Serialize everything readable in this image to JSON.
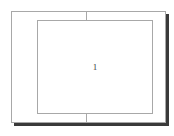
{
  "figure": {
    "background_color": "#ffffff",
    "stroke_color": "#a8a8a8",
    "shadow_color": "#3a3a3a",
    "label_color": "#3c3c3c",
    "outer_frame": {
      "name": "outer rectangle",
      "x": 11,
      "y": 11,
      "width": 155,
      "height": 112
    },
    "inner_frame": {
      "name": "inner rectangle",
      "x": 37,
      "y": 20,
      "width": 116,
      "height": 94
    },
    "dividers": [
      {
        "name": "top divider",
        "x": 86,
        "y": 11,
        "length": 10
      },
      {
        "name": "bottom divider",
        "x": 86,
        "y": 113,
        "length": 10
      }
    ],
    "reference_label": "1"
  }
}
